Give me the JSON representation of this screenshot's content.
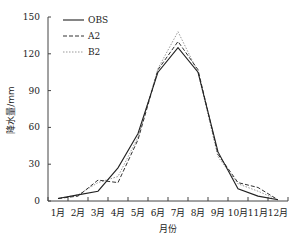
{
  "chart_data": {
    "type": "line",
    "title": "",
    "xlabel": "月份",
    "ylabel": "降水量/mm",
    "categories": [
      "1月",
      "2月",
      "3月",
      "4月",
      "5月",
      "6月",
      "7月",
      "8月",
      "9月",
      "10月",
      "11月",
      "12月"
    ],
    "ylim": [
      0,
      150
    ],
    "yticks": [
      0,
      30,
      60,
      90,
      120,
      150
    ],
    "grid": false,
    "legend_position": "upper-left",
    "series": [
      {
        "name": "OBS",
        "style": "solid",
        "color": "#222222",
        "values": [
          2,
          5,
          8,
          27,
          55,
          105,
          125,
          105,
          40,
          10,
          4,
          1
        ]
      },
      {
        "name": "A2",
        "style": "dashed",
        "color": "#333333",
        "values": [
          2,
          4,
          17,
          15,
          50,
          107,
          130,
          107,
          38,
          15,
          11,
          1
        ]
      },
      {
        "name": "B2",
        "style": "dotted",
        "color": "#999999",
        "values": [
          2,
          5,
          15,
          20,
          52,
          108,
          138,
          105,
          36,
          14,
          8,
          1
        ]
      }
    ]
  }
}
